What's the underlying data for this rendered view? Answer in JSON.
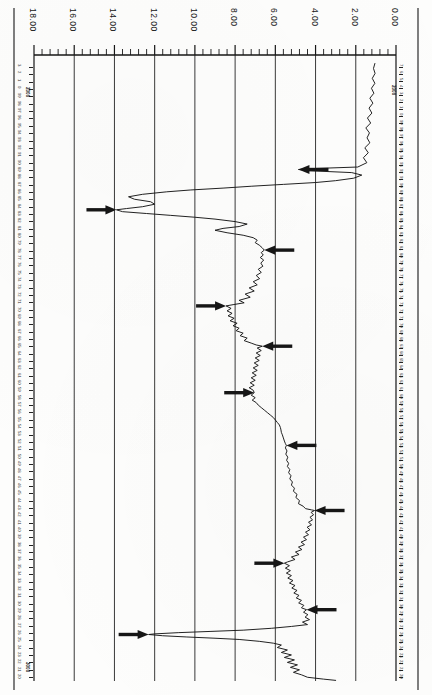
{
  "figure": {
    "orientation": "rotated-90",
    "kind": "well-log-trace",
    "background_color": "#fdfdfc",
    "ink_color": "#161616"
  },
  "top_axis": {
    "name": "top-scale",
    "tick_labels": [
      "18.00",
      "16.00",
      "14.00",
      "12.00",
      "10.00",
      "8.00",
      "6.00",
      "4.00",
      "2.00",
      "0.00"
    ],
    "tick_values": [
      18,
      16,
      14,
      12,
      10,
      8,
      6,
      4,
      2,
      0
    ],
    "minor_ticks_per_interval": 4,
    "axis_left_px": 34,
    "axis_right_px": 396,
    "axis_y_px": 55
  },
  "left_edge_scale": {
    "name": "left-depth-scale",
    "marker_tag": "2000",
    "marker_tag_2": "3000",
    "labels": [
      "3",
      "2",
      "1",
      "0",
      "99",
      "98",
      "97",
      "96",
      "95",
      "94",
      "93",
      "92",
      "91",
      "90",
      "89",
      "88",
      "87",
      "86",
      "85",
      "84",
      "83",
      "82",
      "81",
      "80",
      "79",
      "78",
      "77",
      "76",
      "75",
      "74",
      "73",
      "72",
      "71",
      "70",
      "69",
      "68",
      "67",
      "66",
      "65",
      "64",
      "63",
      "62",
      "61",
      "60",
      "59",
      "58",
      "57",
      "56",
      "55",
      "54",
      "53",
      "52",
      "51",
      "50",
      "49",
      "48",
      "47",
      "46",
      "45",
      "44",
      "43",
      "42",
      "41",
      "40",
      "39",
      "38",
      "37",
      "36",
      "35",
      "34",
      "33",
      "32",
      "31",
      "30",
      "29",
      "28",
      "27",
      "26",
      "25",
      "24",
      "23",
      "22",
      "21",
      "20"
    ]
  },
  "right_edge_scale": {
    "name": "right-depth-scale",
    "marker_tag": "2000",
    "labels": [
      "7",
      "6",
      "5",
      "4",
      "3",
      "2",
      "1",
      "0",
      "99",
      "98",
      "97",
      "96",
      "95",
      "94",
      "93",
      "92",
      "91",
      "90",
      "89",
      "88",
      "87",
      "86",
      "85",
      "84",
      "83",
      "82",
      "81",
      "80",
      "79",
      "78",
      "77",
      "76",
      "75",
      "74",
      "73",
      "72",
      "71",
      "70",
      "69",
      "68",
      "67",
      "66",
      "65",
      "64",
      "63",
      "62",
      "61",
      "60",
      "59",
      "58",
      "57",
      "56",
      "55",
      "54",
      "53",
      "52",
      "51",
      "50",
      "49",
      "48",
      "47",
      "46",
      "45",
      "44",
      "43",
      "42",
      "41",
      "40",
      "39",
      "38",
      "37",
      "36",
      "35",
      "34",
      "33",
      "32",
      "31",
      "30",
      "29",
      "28",
      "27",
      "26",
      "25",
      "24",
      "23",
      "22",
      "21",
      "20"
    ]
  },
  "chart_data": {
    "type": "line",
    "title": "",
    "xlabel": "",
    "ylabel": "",
    "xlim": [
      18,
      0
    ],
    "ylim": [
      0,
      100
    ],
    "grid": true,
    "grid_x_values": [
      18,
      16,
      14,
      12,
      10,
      8,
      6,
      4,
      2,
      0
    ],
    "legend": [],
    "annotations": [
      {
        "label": "arrow-1",
        "direction": "left",
        "tip_x": 4.85,
        "tip_y": 17.5
      },
      {
        "label": "arrow-2",
        "direction": "right",
        "tip_x": 13.9,
        "tip_y": 24.0
      },
      {
        "label": "arrow-3",
        "direction": "left",
        "tip_x": 6.55,
        "tip_y": 30.5
      },
      {
        "label": "arrow-4",
        "direction": "right",
        "tip_x": 8.45,
        "tip_y": 39.5
      },
      {
        "label": "arrow-5",
        "direction": "left",
        "tip_x": 6.65,
        "tip_y": 46.0
      },
      {
        "label": "arrow-6",
        "direction": "right",
        "tip_x": 7.05,
        "tip_y": 53.5
      },
      {
        "label": "arrow-7",
        "direction": "left",
        "tip_x": 5.45,
        "tip_y": 62.0
      },
      {
        "label": "arrow-8",
        "direction": "left",
        "tip_x": 4.05,
        "tip_y": 72.5
      },
      {
        "label": "arrow-9",
        "direction": "right",
        "tip_x": 5.55,
        "tip_y": 81.0
      },
      {
        "label": "arrow-10",
        "direction": "left",
        "tip_x": 4.45,
        "tip_y": 88.5
      },
      {
        "label": "arrow-11",
        "direction": "right",
        "tip_x": 12.3,
        "tip_y": 92.5
      }
    ],
    "series": [
      {
        "name": "trace",
        "points": [
          [
            1.05,
            0.4
          ],
          [
            1.12,
            1.2
          ],
          [
            1.04,
            2.0
          ],
          [
            1.18,
            2.8
          ],
          [
            1.05,
            3.6
          ],
          [
            1.22,
            4.4
          ],
          [
            1.1,
            5.2
          ],
          [
            1.3,
            6.0
          ],
          [
            1.15,
            6.8
          ],
          [
            1.34,
            7.6
          ],
          [
            1.2,
            8.4
          ],
          [
            1.42,
            9.2
          ],
          [
            1.26,
            10.0
          ],
          [
            1.5,
            10.8
          ],
          [
            1.32,
            11.6
          ],
          [
            1.44,
            12.4
          ],
          [
            1.3,
            13.2
          ],
          [
            1.55,
            14.0
          ],
          [
            1.38,
            14.8
          ],
          [
            1.62,
            15.6
          ],
          [
            1.45,
            16.4
          ],
          [
            1.9,
            17.1
          ],
          [
            4.6,
            17.4
          ],
          [
            4.85,
            17.5
          ],
          [
            4.3,
            17.7
          ],
          [
            2.2,
            18.0
          ],
          [
            1.7,
            18.4
          ],
          [
            2.1,
            18.9
          ],
          [
            3.0,
            19.3
          ],
          [
            4.0,
            19.6
          ],
          [
            5.6,
            19.9
          ],
          [
            7.2,
            20.2
          ],
          [
            8.6,
            20.5
          ],
          [
            10.2,
            20.8
          ],
          [
            11.4,
            21.1
          ],
          [
            12.6,
            21.5
          ],
          [
            13.3,
            21.9
          ],
          [
            13.0,
            22.3
          ],
          [
            12.2,
            22.7
          ],
          [
            12.0,
            23.1
          ],
          [
            12.6,
            23.5
          ],
          [
            13.4,
            23.8
          ],
          [
            13.9,
            24.0
          ],
          [
            13.6,
            24.3
          ],
          [
            12.4,
            24.6
          ],
          [
            11.2,
            24.9
          ],
          [
            10.0,
            25.2
          ],
          [
            9.0,
            25.5
          ],
          [
            8.0,
            25.9
          ],
          [
            7.4,
            26.3
          ],
          [
            7.8,
            26.7
          ],
          [
            8.6,
            27.0
          ],
          [
            9.0,
            27.3
          ],
          [
            8.4,
            27.7
          ],
          [
            7.6,
            28.1
          ],
          [
            7.1,
            28.5
          ],
          [
            6.9,
            28.9
          ],
          [
            7.0,
            29.3
          ],
          [
            6.8,
            29.7
          ],
          [
            6.66,
            30.1
          ],
          [
            6.55,
            30.5
          ],
          [
            6.7,
            30.9
          ],
          [
            6.6,
            31.3
          ],
          [
            6.75,
            31.7
          ],
          [
            6.58,
            32.1
          ],
          [
            6.72,
            32.6
          ],
          [
            6.62,
            33.1
          ],
          [
            6.85,
            33.6
          ],
          [
            6.7,
            34.1
          ],
          [
            6.95,
            34.6
          ],
          [
            6.78,
            35.1
          ],
          [
            7.1,
            35.6
          ],
          [
            6.9,
            36.1
          ],
          [
            7.3,
            36.6
          ],
          [
            7.05,
            37.1
          ],
          [
            7.5,
            37.6
          ],
          [
            7.25,
            38.1
          ],
          [
            7.8,
            38.6
          ],
          [
            7.55,
            39.0
          ],
          [
            8.1,
            39.3
          ],
          [
            8.45,
            39.5
          ],
          [
            8.2,
            39.9
          ],
          [
            8.4,
            40.3
          ],
          [
            8.15,
            40.7
          ],
          [
            8.35,
            41.1
          ],
          [
            8.05,
            41.5
          ],
          [
            8.25,
            41.9
          ],
          [
            7.9,
            42.3
          ],
          [
            8.1,
            42.7
          ],
          [
            7.8,
            43.1
          ],
          [
            7.95,
            43.5
          ],
          [
            7.6,
            43.9
          ],
          [
            7.75,
            44.3
          ],
          [
            7.4,
            44.7
          ],
          [
            7.55,
            45.1
          ],
          [
            7.2,
            45.5
          ],
          [
            6.95,
            45.8
          ],
          [
            6.65,
            46.0
          ],
          [
            6.9,
            46.3
          ],
          [
            6.7,
            46.7
          ],
          [
            6.95,
            47.1
          ],
          [
            6.75,
            47.5
          ],
          [
            7.0,
            47.9
          ],
          [
            6.8,
            48.3
          ],
          [
            7.05,
            48.7
          ],
          [
            6.85,
            49.1
          ],
          [
            7.1,
            49.5
          ],
          [
            6.9,
            49.9
          ],
          [
            7.15,
            50.3
          ],
          [
            6.95,
            50.7
          ],
          [
            7.2,
            51.1
          ],
          [
            7.0,
            51.5
          ],
          [
            7.25,
            51.9
          ],
          [
            7.05,
            52.3
          ],
          [
            7.3,
            52.7
          ],
          [
            7.1,
            53.1
          ],
          [
            7.05,
            53.5
          ],
          [
            7.2,
            53.9
          ],
          [
            7.0,
            54.3
          ],
          [
            7.15,
            54.7
          ],
          [
            6.95,
            55.1
          ],
          [
            6.85,
            55.5
          ],
          [
            6.7,
            55.9
          ],
          [
            6.55,
            56.3
          ],
          [
            6.4,
            56.7
          ],
          [
            6.25,
            57.1
          ],
          [
            6.1,
            57.5
          ],
          [
            6.0,
            57.9
          ],
          [
            5.9,
            58.3
          ],
          [
            5.8,
            58.7
          ],
          [
            5.75,
            59.1
          ],
          [
            5.72,
            59.5
          ],
          [
            5.7,
            59.9
          ],
          [
            5.65,
            60.3
          ],
          [
            5.6,
            60.8
          ],
          [
            5.55,
            61.3
          ],
          [
            5.5,
            61.7
          ],
          [
            5.45,
            62.0
          ],
          [
            5.5,
            62.4
          ],
          [
            5.42,
            62.9
          ],
          [
            5.48,
            63.4
          ],
          [
            5.38,
            63.9
          ],
          [
            5.44,
            64.4
          ],
          [
            5.34,
            64.9
          ],
          [
            5.4,
            65.4
          ],
          [
            5.28,
            65.9
          ],
          [
            5.34,
            66.4
          ],
          [
            5.22,
            66.9
          ],
          [
            5.28,
            67.4
          ],
          [
            5.15,
            67.9
          ],
          [
            5.2,
            68.4
          ],
          [
            5.05,
            68.9
          ],
          [
            5.1,
            69.4
          ],
          [
            4.92,
            69.9
          ],
          [
            4.98,
            70.4
          ],
          [
            4.8,
            70.9
          ],
          [
            4.85,
            71.4
          ],
          [
            4.62,
            71.8
          ],
          [
            4.5,
            72.2
          ],
          [
            4.2,
            72.4
          ],
          [
            4.05,
            72.5
          ],
          [
            4.22,
            72.8
          ],
          [
            4.1,
            73.2
          ],
          [
            4.28,
            73.6
          ],
          [
            4.15,
            74.0
          ],
          [
            4.35,
            74.4
          ],
          [
            4.2,
            74.8
          ],
          [
            4.42,
            75.2
          ],
          [
            4.28,
            75.6
          ],
          [
            4.5,
            76.0
          ],
          [
            4.35,
            76.4
          ],
          [
            4.6,
            76.8
          ],
          [
            4.45,
            77.2
          ],
          [
            4.72,
            77.6
          ],
          [
            4.55,
            78.0
          ],
          [
            4.85,
            78.4
          ],
          [
            4.68,
            78.8
          ],
          [
            5.0,
            79.2
          ],
          [
            4.82,
            79.6
          ],
          [
            5.2,
            80.0
          ],
          [
            5.02,
            80.4
          ],
          [
            5.4,
            80.8
          ],
          [
            5.55,
            81.0
          ],
          [
            5.3,
            81.4
          ],
          [
            5.5,
            81.8
          ],
          [
            5.25,
            82.2
          ],
          [
            5.45,
            82.6
          ],
          [
            5.2,
            83.0
          ],
          [
            5.38,
            83.4
          ],
          [
            5.12,
            83.8
          ],
          [
            5.3,
            84.2
          ],
          [
            5.02,
            84.6
          ],
          [
            5.18,
            85.0
          ],
          [
            4.92,
            85.4
          ],
          [
            5.08,
            85.8
          ],
          [
            4.82,
            86.2
          ],
          [
            4.96,
            86.6
          ],
          [
            4.7,
            87.0
          ],
          [
            4.84,
            87.4
          ],
          [
            4.58,
            87.8
          ],
          [
            4.7,
            88.2
          ],
          [
            4.45,
            88.5
          ],
          [
            4.6,
            88.9
          ],
          [
            4.38,
            89.3
          ],
          [
            4.52,
            89.7
          ],
          [
            4.3,
            90.1
          ],
          [
            4.65,
            90.5
          ],
          [
            4.4,
            90.9
          ],
          [
            5.2,
            91.2
          ],
          [
            6.2,
            91.5
          ],
          [
            7.6,
            91.8
          ],
          [
            9.2,
            92.0
          ],
          [
            10.8,
            92.2
          ],
          [
            12.0,
            92.4
          ],
          [
            12.3,
            92.5
          ],
          [
            11.6,
            92.7
          ],
          [
            10.4,
            92.9
          ],
          [
            9.0,
            93.1
          ],
          [
            7.8,
            93.3
          ],
          [
            6.8,
            93.6
          ],
          [
            6.1,
            93.9
          ],
          [
            5.7,
            94.2
          ],
          [
            5.9,
            94.6
          ],
          [
            5.4,
            95.0
          ],
          [
            5.7,
            95.4
          ],
          [
            5.2,
            95.8
          ],
          [
            5.55,
            96.2
          ],
          [
            5.05,
            96.6
          ],
          [
            5.4,
            97.0
          ],
          [
            4.9,
            97.4
          ],
          [
            5.25,
            97.8
          ],
          [
            4.8,
            98.2
          ],
          [
            5.1,
            98.6
          ],
          [
            4.7,
            99.0
          ],
          [
            4.4,
            99.4
          ],
          [
            3.6,
            99.7
          ],
          [
            3.0,
            99.9
          ]
        ]
      }
    ]
  }
}
